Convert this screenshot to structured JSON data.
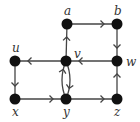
{
  "diagram": {
    "type": "directed-graph",
    "nodes": [
      {
        "id": "a",
        "label": "a",
        "x": 67,
        "y": 24,
        "label_x": 64,
        "label_y": 15
      },
      {
        "id": "b",
        "label": "b",
        "x": 117,
        "y": 24,
        "label_x": 114,
        "label_y": 15
      },
      {
        "id": "u",
        "label": "u",
        "x": 15,
        "y": 61,
        "label_x": 12,
        "label_y": 52
      },
      {
        "id": "v",
        "label": "v",
        "x": 66,
        "y": 61,
        "label_x": 74,
        "label_y": 58
      },
      {
        "id": "w",
        "label": "w",
        "x": 117,
        "y": 61,
        "label_x": 126,
        "label_y": 66
      },
      {
        "id": "x",
        "label": "x",
        "x": 15,
        "y": 99,
        "label_x": 12,
        "label_y": 116
      },
      {
        "id": "y",
        "label": "y",
        "x": 66,
        "y": 99,
        "label_x": 63,
        "label_y": 116
      },
      {
        "id": "z",
        "label": "z",
        "x": 117,
        "y": 99,
        "label_x": 114,
        "label_y": 116
      }
    ],
    "edges": [
      {
        "from": "a",
        "to": "b"
      },
      {
        "from": "b",
        "to": "w"
      },
      {
        "from": "w",
        "to": "v"
      },
      {
        "from": "v",
        "to": "a"
      },
      {
        "from": "v",
        "to": "u"
      },
      {
        "from": "u",
        "to": "x"
      },
      {
        "from": "x",
        "to": "y"
      },
      {
        "from": "y",
        "to": "z"
      },
      {
        "from": "z",
        "to": "w"
      },
      {
        "from": "v",
        "to": "y",
        "curve": "right"
      },
      {
        "from": "y",
        "to": "v",
        "curve": "left"
      }
    ]
  }
}
